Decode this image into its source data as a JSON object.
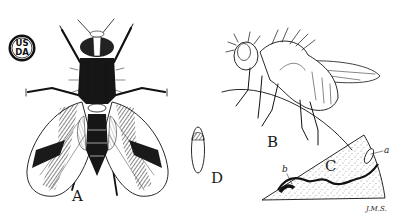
{
  "plate": {
    "background": "#ffffff",
    "ink_color": "#111111",
    "seal": {
      "line1": "US",
      "line2": "DA"
    },
    "figures": [
      {
        "id": "A",
        "label": "A",
        "description": "adult fly, dorsal view with banded wings"
      },
      {
        "id": "B",
        "label": "B",
        "description": "adult fly, side view resting on twig"
      },
      {
        "id": "C",
        "label": "C",
        "description": "leaf section showing mine",
        "sublabels": {
          "a": "a",
          "b": "b"
        }
      },
      {
        "id": "D",
        "label": "D",
        "description": "pupa"
      }
    ],
    "signature": "J.M.S."
  }
}
